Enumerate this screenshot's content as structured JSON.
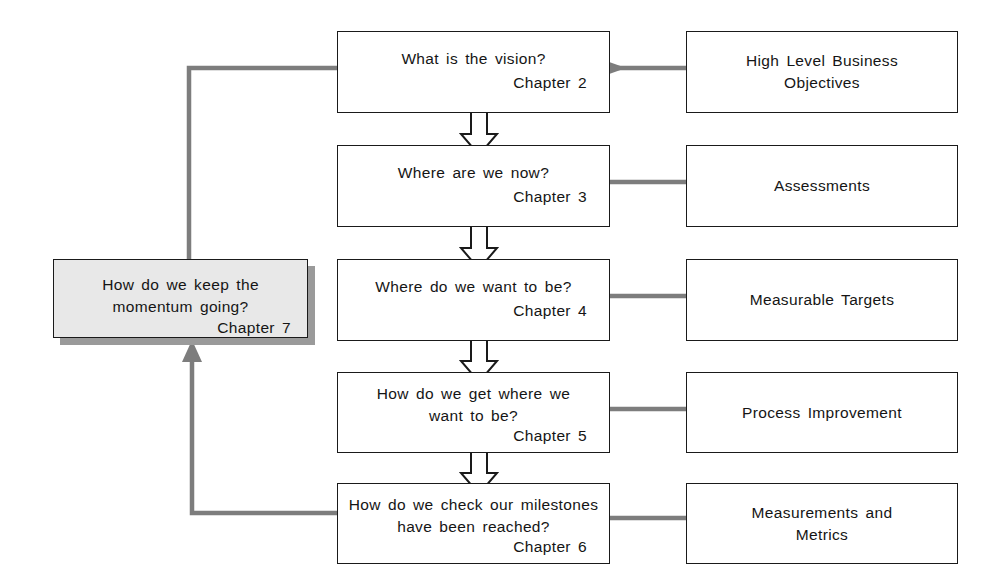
{
  "diagram": {
    "colors": {
      "connector_gray": "#7d7d7d",
      "box_border": "#1a1a1a",
      "loop_box_fill": "#e8e8e8",
      "loop_box_shadow": "#9a9a9a",
      "text": "#151515",
      "background": "#ffffff"
    },
    "stages": [
      {
        "id": "stage-vision",
        "question": "What is the vision?",
        "chapter": "Chapter 2",
        "detail": "High Level Business\nObjectives",
        "detail_id": "detail-objectives"
      },
      {
        "id": "stage-current-state",
        "question": "Where are we now?",
        "chapter": "Chapter 3",
        "detail": "Assessments",
        "detail_id": "detail-assessments"
      },
      {
        "id": "stage-target-state",
        "question": "Where do we want to be?",
        "chapter": "Chapter 4",
        "detail": "Measurable Targets",
        "detail_id": "detail-targets"
      },
      {
        "id": "stage-approach",
        "question": "How do we get where we\nwant to be?",
        "chapter": "Chapter 5",
        "detail": "Process Improvement",
        "detail_id": "detail-process-improvement"
      },
      {
        "id": "stage-verification",
        "question": "How do we check our milestones\nhave been reached?",
        "chapter": "Chapter 6",
        "detail": "Measurements and\nMetrics",
        "detail_id": "detail-measurements"
      }
    ],
    "loop_node": {
      "id": "loop-momentum",
      "question": "How do we keep the\nmomentum going?",
      "chapter": "Chapter 7"
    }
  }
}
